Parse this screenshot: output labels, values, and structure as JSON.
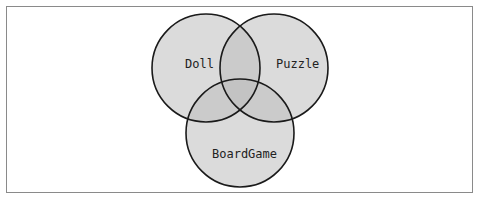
{
  "diagram": {
    "type": "venn",
    "sets": [
      {
        "label": "Doll",
        "cx": 206,
        "cy": 68,
        "r": 54
      },
      {
        "label": "Puzzle",
        "cx": 274,
        "cy": 68,
        "r": 54
      },
      {
        "label": "BoardGame",
        "cx": 240,
        "cy": 133,
        "r": 54
      }
    ],
    "colors": {
      "circle_fill": "#d8d8d8",
      "circle_stroke": "#1a1a1a",
      "frame_border": "#8a8a8a"
    }
  }
}
